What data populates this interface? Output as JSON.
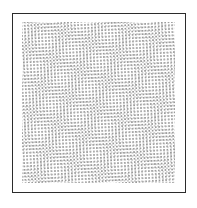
{
  "image": {
    "kind": "halftone-dot-texture",
    "description": "Framed white panel filled with a dense field of small light-gray dots on a slightly rotated grid, producing a moire pattern",
    "caption": "",
    "width_px": 197,
    "height_px": 208
  },
  "frame": {
    "border_color": "#2b2b2b",
    "background_color": "#ffffff",
    "border_width_px": 1.5,
    "left_px": 12,
    "top_px": 13,
    "width_px": 174,
    "height_px": 180
  },
  "dot_field": {
    "dot_color": "#8f8f8f",
    "secondary_dot_color": "#b8b8b8",
    "background_color": "#ffffff",
    "dot_spacing_px": 3.35,
    "dot_diameter_px": 1.1,
    "rotation_deg": -4,
    "secondary_rotation_deg": 2.2,
    "left_px": 9,
    "top_px": 8,
    "width_px": 153,
    "height_px": 161
  }
}
